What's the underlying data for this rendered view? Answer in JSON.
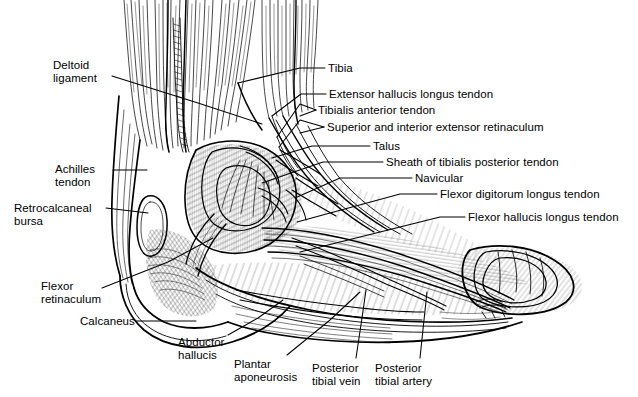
{
  "figure": {
    "style": "pen-and-ink anatomical line engraving",
    "width": 638,
    "height": 397,
    "background_color": "#ffffff",
    "ink_color": "#000000"
  },
  "labels": [
    {
      "id": "deltoid-ligament",
      "text": "Deltoid\nligament",
      "align": "left",
      "x": 53,
      "y": 59,
      "leader": [
        [
          112,
          76
        ],
        [
          198,
          103
        ],
        [
          262,
          124
        ]
      ]
    },
    {
      "id": "achilles-tendon",
      "text": "Achilles\ntendon",
      "align": "left",
      "x": 55,
      "y": 163,
      "leader": [
        [
          113,
          170
        ],
        [
          147,
          170
        ]
      ]
    },
    {
      "id": "retrocalcaneal-bursa",
      "text": "Retrocalcaneal\nbursa",
      "align": "left",
      "x": 14,
      "y": 202,
      "leader": [
        [
          106,
          208
        ],
        [
          148,
          213
        ]
      ]
    },
    {
      "id": "flexor-retinaculum",
      "text": "Flexor\nretinaculum",
      "align": "left",
      "x": 41,
      "y": 280,
      "leader": [
        [
          102,
          288
        ],
        [
          168,
          262
        ],
        [
          213,
          238
        ]
      ]
    },
    {
      "id": "calcaneus",
      "text": "Calcaneus",
      "align": "left",
      "x": 80,
      "y": 315,
      "leader": [
        [
          136,
          321
        ],
        [
          196,
          321
        ]
      ]
    },
    {
      "id": "tibia",
      "text": "Tibia",
      "align": "left",
      "x": 328,
      "y": 62,
      "leader": [
        [
          325,
          68
        ],
        [
          300,
          68
        ],
        [
          238,
          83
        ]
      ]
    },
    {
      "id": "extensor-hallucis-longus-tendon",
      "text": "Extensor hallucis longus tendon",
      "align": "left",
      "x": 329,
      "y": 88,
      "leader": [
        [
          326,
          94
        ],
        [
          301,
          94
        ],
        [
          272,
          116
        ]
      ]
    },
    {
      "id": "tibialis-anterior-tendon",
      "text": "Tibialis anterior tendon",
      "align": "left",
      "x": 318,
      "y": 104,
      "leader": [
        [
          316,
          110
        ],
        [
          300,
          104
        ],
        [
          277,
          137
        ],
        [
          300,
          116
        ]
      ]
    },
    {
      "id": "superior-and-interior-extensor-retinaculum",
      "text": "Superior and interior extensor retinaculum",
      "align": "left",
      "x": 327,
      "y": 121,
      "leader": [
        [
          324,
          127
        ],
        [
          300,
          120
        ],
        [
          279,
          147
        ],
        [
          300,
          133
        ]
      ]
    },
    {
      "id": "talus",
      "text": "Talus",
      "align": "left",
      "x": 373,
      "y": 140,
      "leader": [
        [
          370,
          146
        ],
        [
          312,
          146
        ],
        [
          272,
          158
        ]
      ]
    },
    {
      "id": "sheath-of-tibialis-posterior-tendon",
      "text": "Sheath of tibialis posterior tendon",
      "align": "left",
      "x": 386,
      "y": 156,
      "leader": [
        [
          383,
          162
        ],
        [
          323,
          162
        ],
        [
          262,
          183
        ]
      ]
    },
    {
      "id": "navicular",
      "text": "Navicular",
      "align": "left",
      "x": 415,
      "y": 172,
      "leader": [
        [
          412,
          178
        ],
        [
          340,
          178
        ],
        [
          295,
          198
        ]
      ]
    },
    {
      "id": "flexor-digitorum-longus-tendon",
      "text": "Flexor digitorum longus tendon",
      "align": "left",
      "x": 440,
      "y": 188,
      "leader": [
        [
          437,
          194
        ],
        [
          400,
          194
        ],
        [
          297,
          222
        ]
      ]
    },
    {
      "id": "flexor-hallucis-longus-tendon",
      "text": "Flexor hallucis longus tendon",
      "align": "left",
      "x": 468,
      "y": 211,
      "leader": [
        [
          465,
          217
        ],
        [
          440,
          217
        ],
        [
          300,
          252
        ]
      ]
    },
    {
      "id": "abductor-hallucis",
      "text": "Abductor\nhallucis",
      "align": "left",
      "x": 178,
      "y": 336,
      "leader": [
        [
          228,
          335
        ],
        [
          258,
          318
        ],
        [
          283,
          300
        ]
      ]
    },
    {
      "id": "plantar-aponeurosis",
      "text": "Plantar\naponeurosis",
      "align": "left",
      "x": 234,
      "y": 358,
      "leader": [
        [
          287,
          355
        ],
        [
          330,
          320
        ],
        [
          360,
          292
        ]
      ]
    },
    {
      "id": "posterior-tibial-vein",
      "text": "Posterior\ntibial vein",
      "align": "left",
      "x": 312,
      "y": 362,
      "leader": [
        [
          356,
          358
        ],
        [
          362,
          318
        ],
        [
          366,
          290
        ]
      ]
    },
    {
      "id": "posterior-tibial-artery",
      "text": "Posterior\ntibial artery",
      "align": "left",
      "x": 375,
      "y": 362,
      "leader": [
        [
          420,
          358
        ],
        [
          424,
          320
        ],
        [
          427,
          292
        ]
      ]
    }
  ]
}
